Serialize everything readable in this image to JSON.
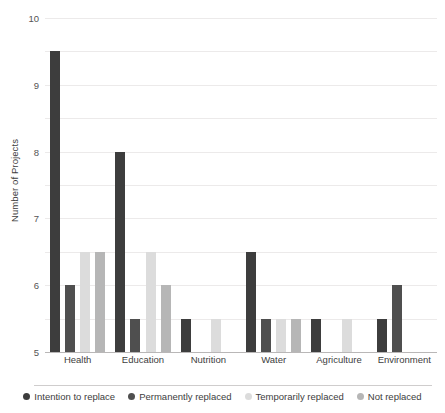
{
  "chart_data": {
    "type": "bar",
    "title": "",
    "xlabel": "",
    "ylabel": "Number of Projects",
    "ylim": [
      0,
      10
    ],
    "ytick_step": 1,
    "yticks": [
      0,
      1,
      2,
      3,
      4,
      5,
      6,
      7,
      8,
      9,
      10
    ],
    "grid": true,
    "legend_position": "bottom",
    "categories": [
      "Health",
      "Education",
      "Nutrition",
      "Water",
      "Agriculture",
      "Environment"
    ],
    "series": [
      {
        "name": "Intention to replace",
        "color": "#3d3d3d",
        "values": [
          9,
          6,
          1,
          3,
          1,
          1
        ]
      },
      {
        "name": "Permanently replaced",
        "color": "#4f4f4f",
        "values": [
          2,
          1,
          0,
          1,
          0,
          2
        ]
      },
      {
        "name": "Temporarily replaced",
        "color": "#dcdcdc",
        "values": [
          3,
          3,
          1,
          1,
          1,
          0
        ]
      },
      {
        "name": "Not replaced",
        "color": "#b6b6b6",
        "values": [
          3,
          2,
          0,
          1,
          0,
          0
        ]
      }
    ]
  },
  "colors": {
    "gridline": "#eceaea",
    "axis": "#b9b7b7",
    "text": "#3d3d3d",
    "tick_text": "#555454",
    "background": "#ffffff"
  }
}
